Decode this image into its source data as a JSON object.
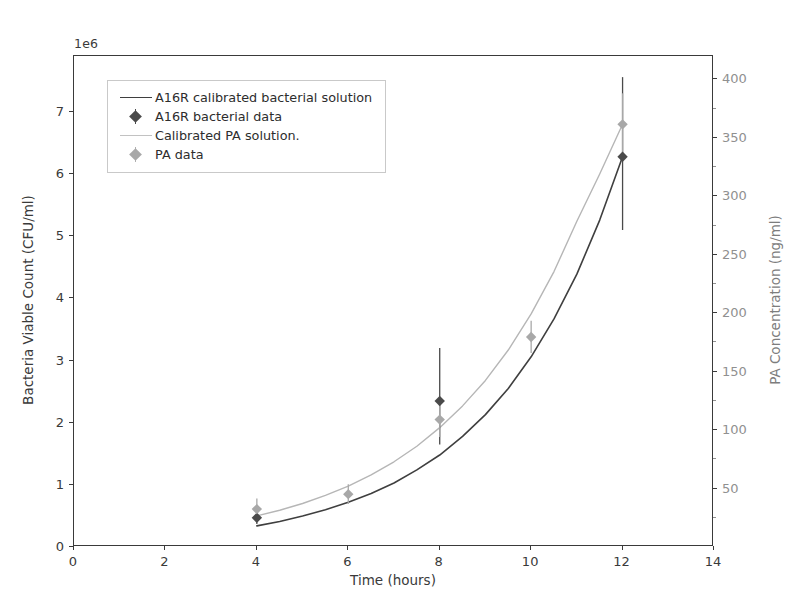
{
  "figure": {
    "offset_text": "1e6",
    "background": "#ffffff",
    "width": 793,
    "height": 612
  },
  "axes": {
    "x": {
      "label": "Time (hours)",
      "ticks": [
        0,
        2,
        4,
        6,
        8,
        10,
        12,
        14
      ],
      "lim": [
        0,
        14
      ]
    },
    "y_left": {
      "label": "Bacteria Viable Count (CFU/ml)",
      "ticks": [
        0,
        1,
        2,
        3,
        4,
        5,
        6,
        7
      ],
      "lim": [
        0,
        7.9
      ],
      "offset": "1e6",
      "color": "#3a3a3a"
    },
    "y_right": {
      "label": "PA Concentration (ng/ml)",
      "ticks": [
        50,
        100,
        150,
        200,
        250,
        300,
        350,
        400
      ],
      "lim": [
        0,
        420
      ],
      "color": "#909090"
    }
  },
  "legend": {
    "entries": [
      {
        "label": "A16R calibrated bacterial solution",
        "key": "line",
        "color": "#3f3f3f"
      },
      {
        "label": "A16R bacterial data",
        "key": "marker",
        "color": "#4a4a4a"
      },
      {
        "label": "Calibrated PA solution.",
        "key": "line",
        "color": "#b6b6b6"
      },
      {
        "label": "PA data",
        "key": "marker",
        "color": "#a8a8a8"
      }
    ]
  },
  "chart_data": {
    "type": "line",
    "title": "",
    "xlabel": "Time (hours)",
    "ylabel": "Bacteria Viable Count (CFU/ml)",
    "ylabel_right": "PA Concentration (ng/ml)",
    "xlim": [
      0,
      14
    ],
    "ylim": [
      0,
      7.9
    ],
    "ylim_right": [
      0,
      420
    ],
    "y_offset_multiplier": "1e6",
    "grid": false,
    "legend_position": "upper left",
    "series": [
      {
        "name": "A16R calibrated bacterial solution",
        "type": "line",
        "axis": "left",
        "color": "#3f3f3f",
        "linewidth": 1.6,
        "x": [
          4.0,
          4.5,
          5.0,
          5.5,
          6.0,
          6.5,
          7.0,
          7.5,
          8.0,
          8.5,
          9.0,
          9.5,
          10.0,
          10.5,
          11.0,
          11.5,
          12.0
        ],
        "y": [
          0.34,
          0.41,
          0.5,
          0.6,
          0.72,
          0.86,
          1.03,
          1.24,
          1.48,
          1.78,
          2.13,
          2.55,
          3.06,
          3.67,
          4.39,
          5.26,
          6.28
        ]
      },
      {
        "name": "Calibrated PA solution.",
        "type": "line",
        "axis": "right",
        "color": "#b6b6b6",
        "linewidth": 1.4,
        "x": [
          4.0,
          4.5,
          5.0,
          5.5,
          6.0,
          6.5,
          7.0,
          7.5,
          8.0,
          8.5,
          9.0,
          9.5,
          10.0,
          10.5,
          11.0,
          11.5,
          12.0
        ],
        "y_left_equiv": [
          0.5,
          0.59,
          0.7,
          0.83,
          0.98,
          1.16,
          1.37,
          1.62,
          1.92,
          2.27,
          2.68,
          3.17,
          3.75,
          4.43,
          5.24,
          6.0,
          6.8
        ],
        "y": [
          26.6,
          31.4,
          37.2,
          44.1,
          52.1,
          61.7,
          72.9,
          86.2,
          102.1,
          120.7,
          142.5,
          168.5,
          199.4,
          235.6,
          278.6,
          319.1,
          361.6
        ]
      },
      {
        "name": "A16R bacterial data",
        "type": "scatter",
        "axis": "left",
        "color": "#4a4a4a",
        "marker": "diamond",
        "x": [
          4,
          8,
          12
        ],
        "y": [
          0.47,
          2.35,
          6.28
        ],
        "yerr_low": [
          0.1,
          0.7,
          1.18
        ],
        "yerr_high": [
          0.1,
          0.85,
          1.28
        ]
      },
      {
        "name": "PA data",
        "type": "scatter",
        "axis": "right",
        "color": "#a8a8a8",
        "marker": "diamond",
        "x": [
          4,
          6,
          8,
          10,
          12
        ],
        "y_left_equiv": [
          0.61,
          0.85,
          2.05,
          3.38,
          6.8
        ],
        "y": [
          32.4,
          45.2,
          109.0,
          179.7,
          361.6
        ],
        "yerr_low_left": [
          0.17,
          0.16,
          0.28,
          0.26,
          0.5
        ],
        "yerr_high_left": [
          0.17,
          0.16,
          0.28,
          0.26,
          0.5
        ]
      }
    ]
  }
}
